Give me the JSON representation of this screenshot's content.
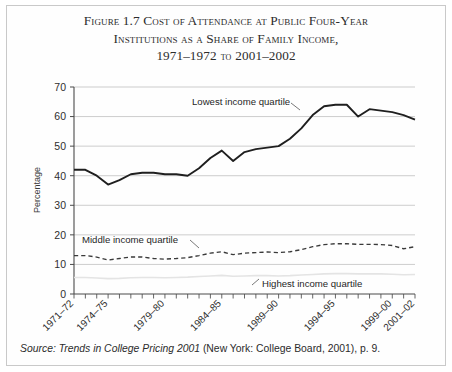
{
  "figure": {
    "title_line1": "Figure 1.7  Cost of Attendance at Public Four-Year",
    "title_line2": "Institutions as a Share of Family Income,",
    "title_line3_years1": "1971–1972",
    "title_line3_to": "to",
    "title_line3_years2": "2001–2002",
    "source_prefix": "Source: Trends in College Pricing 2001",
    "source_rest": "(New York: College Board, 2001), p. 9."
  },
  "chart_data": {
    "type": "line",
    "xlabel": "",
    "ylabel": "Percentage",
    "ylim": [
      0,
      70
    ],
    "yticks": [
      0,
      10,
      20,
      30,
      40,
      50,
      60,
      70
    ],
    "grid": "horizontal",
    "legend": "inline-annotations",
    "x": [
      "1971-72",
      "1972-73",
      "1973-74",
      "1974-75",
      "1975-76",
      "1976-77",
      "1977-78",
      "1978-79",
      "1979-80",
      "1980-81",
      "1981-82",
      "1982-83",
      "1983-84",
      "1984-85",
      "1985-86",
      "1986-87",
      "1987-88",
      "1988-89",
      "1989-90",
      "1990-91",
      "1991-92",
      "1992-93",
      "1993-94",
      "1994-95",
      "1995-96",
      "1996-97",
      "1997-98",
      "1998-99",
      "1999-00",
      "2000-01",
      "2001-02"
    ],
    "xtick_labels": [
      "1971–72",
      "1974–75",
      "1979–80",
      "1984–85",
      "1989–90",
      "1994–95",
      "1999–00",
      "2001–02"
    ],
    "xtick_indices": [
      0,
      3,
      8,
      13,
      18,
      23,
      28,
      30
    ],
    "series": [
      {
        "name": "Lowest income quartile",
        "style": "solid",
        "color": "#222222",
        "values": [
          42,
          42,
          40,
          37,
          38.5,
          40.5,
          41,
          41,
          40.5,
          40.5,
          40,
          42.5,
          46,
          48.5,
          45,
          48,
          49,
          49.5,
          50,
          52.5,
          56,
          60.5,
          63.5,
          64,
          64,
          60,
          62.5,
          62,
          61.5,
          60.5,
          59
        ]
      },
      {
        "name": "Middle income quartile",
        "style": "dashed",
        "color": "#3a3a3a",
        "values": [
          13,
          13,
          12.5,
          11.5,
          12,
          12.5,
          12.5,
          12,
          11.8,
          12,
          12.3,
          13,
          13.8,
          14.3,
          13.3,
          13.8,
          14,
          14.2,
          14,
          14.3,
          15,
          16,
          16.7,
          17,
          17,
          16.8,
          16.8,
          16.7,
          16.4,
          15.3,
          16
        ]
      },
      {
        "name": "Highest income quartile",
        "style": "solid",
        "color": "#e2e2e2",
        "values": [
          5.6,
          5.6,
          5.4,
          5.2,
          5.3,
          5.5,
          5.6,
          5.6,
          5.5,
          5.6,
          5.7,
          5.9,
          6.1,
          6.3,
          6,
          6.1,
          6.2,
          6.2,
          6.1,
          6.2,
          6.4,
          6.6,
          6.8,
          6.9,
          6.9,
          6.8,
          6.8,
          6.8,
          6.7,
          6.5,
          6.6
        ]
      }
    ],
    "annotations": [
      {
        "text": "Lowest income quartile",
        "series": "Lowest income quartile"
      },
      {
        "text": "Middle income quartile",
        "series": "Middle income quartile"
      },
      {
        "text": "Highest income quartile",
        "series": "Highest income quartile"
      }
    ]
  }
}
